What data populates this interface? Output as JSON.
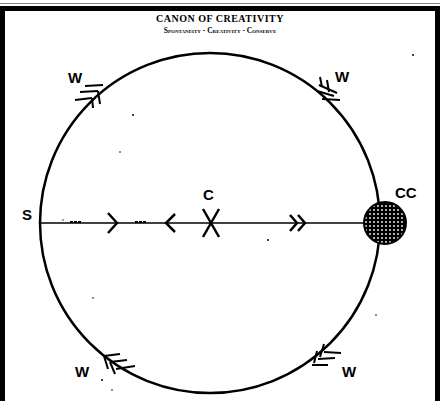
{
  "title": "CANON OF CREATIVITY",
  "subtitle": "Spontaneity - Creativity - Conserve",
  "labels": {
    "s": "S",
    "c": "C",
    "cc": "CC",
    "w_top_left": "W",
    "w_top_right": "W",
    "w_bottom_left": "W",
    "w_bottom_right": "W"
  },
  "diagram": {
    "circle": {
      "cx": 210,
      "cy": 223,
      "r": 170
    },
    "colors": {
      "stroke": "#000000",
      "background": "#ffffff"
    }
  }
}
